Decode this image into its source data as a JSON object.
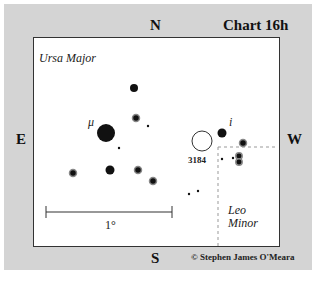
{
  "chart": {
    "title": "Chart 16h",
    "directions": {
      "north": "N",
      "south": "S",
      "east": "E",
      "west": "W"
    },
    "constellations": {
      "upper_left": "Ursa Major",
      "lower_right_line1": "Leo",
      "lower_right_line2": "Minor"
    },
    "star_labels": {
      "mu": "μ",
      "i": "i"
    },
    "object_label": "3184",
    "scale_label": "1°",
    "copyright": "© Stephen James O'Meara"
  },
  "colors": {
    "background": "#d4d4d4",
    "frame": "#ffffff",
    "ink": "#111111",
    "boundary": "#999999"
  }
}
